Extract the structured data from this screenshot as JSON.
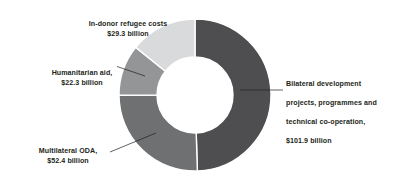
{
  "chart_data": {
    "type": "pie",
    "variant": "donut",
    "title": "",
    "subtitle": "",
    "xlabel": "",
    "ylabel": "",
    "units": "USD billion",
    "total": 205.9,
    "legend_position": "callout-labels",
    "grid": false,
    "categories": [
      "Bilateral development projects, programmes and technical co-operation",
      "Multilateral ODA",
      "Humanitarian aid",
      "In-donor refugee costs"
    ],
    "values": [
      101.9,
      52.4,
      22.3,
      29.3
    ],
    "value_labels": [
      "$101.9 billion",
      "$52.4 billion",
      "$22.3 billion",
      "$29.3 billion"
    ],
    "colors": [
      "#4e4e50",
      "#6f7072",
      "#939597",
      "#d9dadb"
    ],
    "slices": [
      {
        "name": "Bilateral development projects, programmes and technical co-operation",
        "label_line1": "Bilateral development",
        "label_line2": "projects, programmes and",
        "label_line3": "technical co-operation,",
        "value": 101.9,
        "value_label": "$101.9 billion",
        "color": "#4e4e50",
        "start_angle": 0,
        "end_angle": 178.2
      },
      {
        "name": "Multilateral ODA",
        "label_line1": "Multilateral ODA,",
        "value": 52.4,
        "value_label": "$52.4 billion",
        "color": "#6f7072",
        "start_angle": 178.2,
        "end_angle": 269.8
      },
      {
        "name": "Humanitarian aid",
        "label_line1": "Humanitarian aid,",
        "value": 22.3,
        "value_label": "$22.3 billion",
        "color": "#939597",
        "start_angle": 269.8,
        "end_angle": 308.8
      },
      {
        "name": "In-donor refugee costs",
        "label_line1": "In-donor refugee costs",
        "value": 29.3,
        "value_label": "$29.3 billion",
        "color": "#d9dadb",
        "start_angle": 308.8,
        "end_angle": 360
      }
    ],
    "geometry": {
      "center_x": 195,
      "center_y": 95,
      "outer_radius": 76,
      "inner_radius": 38,
      "separator_color": "#ffffff",
      "separator_width": 1.4
    },
    "background_color": "#ffffff",
    "text_color": "#231f20",
    "leader_line_color": "#231f20"
  }
}
